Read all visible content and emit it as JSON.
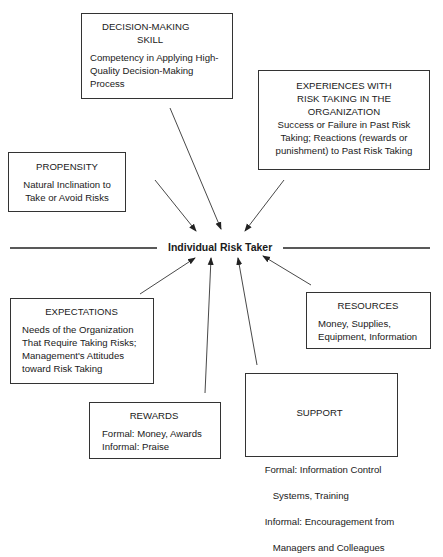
{
  "center": {
    "label": "Individual Risk Taker"
  },
  "boxes": {
    "decision_making": {
      "title_lines": [
        "DECISION-MAKING",
        "SKILL"
      ],
      "body_lines": [
        "Competency in Applying High-",
        "Quality Decision-Making",
        "Process"
      ]
    },
    "experiences": {
      "title_lines": [
        "EXPERIENCES WITH",
        "RISK TAKING IN THE",
        "ORGANIZATION"
      ],
      "body_lines": [
        "Success or Failure in Past Risk",
        "Taking; Reactions (rewards or",
        "punishment) to Past Risk Taking"
      ]
    },
    "propensity": {
      "title_lines": [
        "PROPENSITY"
      ],
      "body_lines": [
        "Natural Inclination to",
        "Take or Avoid Risks"
      ]
    },
    "expectations": {
      "title_lines": [
        "EXPECTATIONS"
      ],
      "body_lines": [
        "Needs of the Organization",
        "That Require Taking Risks;",
        "Management's Attitudes",
        "toward Risk Taking"
      ]
    },
    "resources": {
      "title_lines": [
        "RESOURCES"
      ],
      "body_lines": [
        "Money, Supplies,",
        "Equipment, Information"
      ]
    },
    "rewards": {
      "title_lines": [
        "REWARDS"
      ],
      "body_lines": [
        "Formal: Money, Awards",
        "Informal: Praise"
      ]
    },
    "support": {
      "title_lines": [
        "SUPPORT"
      ],
      "body_lines": [
        "Formal: Information Control",
        "   Systems, Training",
        "Informal: Encouragement from",
        "   Managers and Colleagues"
      ]
    }
  },
  "colors": {
    "line": "#333333",
    "text": "#1a1a1a",
    "background": "#ffffff"
  }
}
